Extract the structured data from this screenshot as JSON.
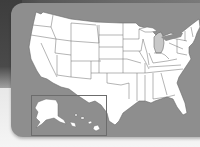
{
  "map": {
    "title": "United States map",
    "type": "state outline map",
    "highlighted_state": "Michigan",
    "colors": {
      "background_dark": "#4a4a4a",
      "panel": "#8e8e8e",
      "state_fill": "#ffffff",
      "state_border": "#6a6a6a",
      "highlight_fill": "#c8c8c8"
    },
    "insets": [
      "Alaska",
      "Hawaii"
    ]
  }
}
